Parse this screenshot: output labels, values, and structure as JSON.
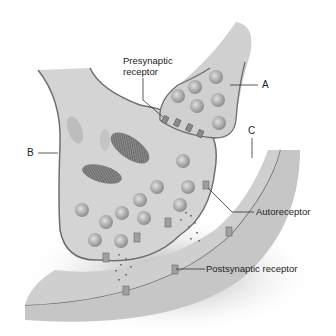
{
  "diagram": {
    "labels": {
      "presynaptic_line1": "Presynaptic",
      "presynaptic_line2": "receptor",
      "a": "A",
      "b": "B",
      "c": "C",
      "autoreceptor": "Autoreceptor",
      "postsynaptic": "Postsynaptic receptor"
    },
    "colors": {
      "background": "#ffffff",
      "cell_fill": "#d2d2d2",
      "membrane": "#6e6e6e",
      "vesicle": "#a9a9a9",
      "cleft": "#c4c4c4",
      "text": "#222222"
    }
  }
}
